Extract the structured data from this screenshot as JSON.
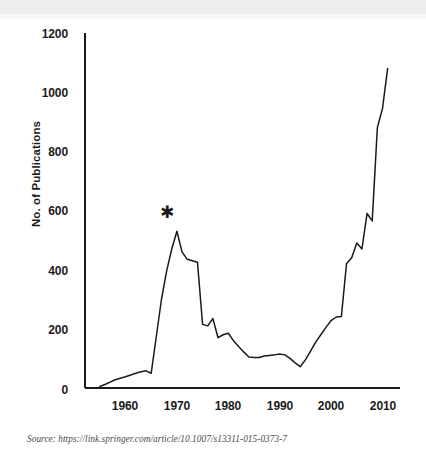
{
  "figure": {
    "source_note": "Source: https://link.springer.com/article/10.1007/s13311-015-0373-7",
    "annotation_star": "✱"
  },
  "chart_data": {
    "type": "line",
    "title": "",
    "subtitle": "",
    "xlabel": "",
    "ylabel": "No. of Publications",
    "xlim": [
      1955,
      2011
    ],
    "ylim": [
      0,
      1200
    ],
    "grid": false,
    "legend": false,
    "legend_position": "none",
    "line_color": "#1a1a1a",
    "xticks": [
      1960,
      1970,
      1980,
      1990,
      2000,
      2010
    ],
    "xtick_labels": [
      "1960",
      "1970",
      "1980",
      "1990",
      "2000",
      "2010"
    ],
    "yticks": [
      0,
      200,
      400,
      600,
      800,
      1000,
      1200
    ],
    "ytick_labels": [
      "0",
      "200",
      "400",
      "600",
      "800",
      "1000",
      "1200"
    ],
    "annotations": [
      {
        "text": "*",
        "x": 1970,
        "y": 610,
        "note": "star marking the 1970 peak"
      }
    ],
    "x": [
      1955,
      1956,
      1957,
      1958,
      1959,
      1960,
      1961,
      1962,
      1963,
      1964,
      1965,
      1966,
      1967,
      1968,
      1969,
      1970,
      1971,
      1972,
      1973,
      1974,
      1975,
      1976,
      1977,
      1978,
      1979,
      1980,
      1981,
      1982,
      1983,
      1984,
      1985,
      1986,
      1987,
      1988,
      1989,
      1990,
      1991,
      1992,
      1993,
      1994,
      1995,
      1996,
      1997,
      1998,
      1999,
      2000,
      2001,
      2002,
      2003,
      2004,
      2005,
      2006,
      2007,
      2008,
      2009,
      2010,
      2011
    ],
    "y": [
      5,
      12,
      20,
      28,
      33,
      38,
      44,
      50,
      55,
      58,
      50,
      175,
      300,
      395,
      470,
      530,
      460,
      435,
      430,
      425,
      215,
      210,
      235,
      170,
      180,
      185,
      160,
      140,
      122,
      105,
      103,
      103,
      108,
      110,
      112,
      115,
      112,
      100,
      85,
      72,
      95,
      125,
      155,
      180,
      205,
      228,
      240,
      242,
      420,
      440,
      490,
      470,
      590,
      565,
      880,
      945,
      1080
    ],
    "series": [
      {
        "name": "No. of Publications",
        "values": [
          5,
          12,
          20,
          28,
          33,
          38,
          44,
          50,
          55,
          58,
          50,
          175,
          300,
          395,
          470,
          530,
          460,
          435,
          430,
          425,
          215,
          210,
          235,
          170,
          180,
          185,
          160,
          140,
          122,
          105,
          103,
          103,
          108,
          110,
          112,
          115,
          112,
          100,
          85,
          72,
          95,
          125,
          155,
          180,
          205,
          228,
          240,
          242,
          420,
          440,
          490,
          470,
          590,
          565,
          880,
          945,
          1080
        ]
      }
    ]
  }
}
